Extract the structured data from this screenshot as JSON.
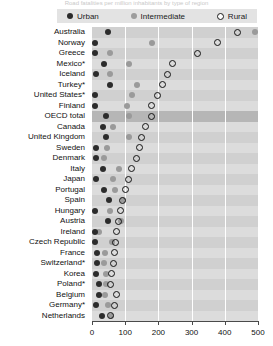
{
  "title": "Road fatalities per million inhabitants by type of region",
  "legend": {
    "position": "top",
    "items": [
      {
        "key": "urban",
        "label": "Urban",
        "marker": "filled-dark-circle",
        "color": "#2c2c2c"
      },
      {
        "key": "intermediate",
        "label": "Intermediate",
        "marker": "filled-gray-circle",
        "color": "#9a9a9a"
      },
      {
        "key": "rural",
        "label": "Rural",
        "marker": "open-circle",
        "color": "#141414"
      }
    ]
  },
  "axis": {
    "x_ticks": [
      "0",
      "100",
      "200",
      "300",
      "400",
      "500"
    ],
    "x_min": 0,
    "x_max": 500
  },
  "chart_data": {
    "type": "scatter",
    "title": "Road fatalities per million inhabitants by type of region",
    "xlabel": "",
    "ylabel": "",
    "xlim": [
      0,
      500
    ],
    "grid": true,
    "legend_position": "top",
    "categories": [
      "Australia",
      "Norway",
      "Greece",
      "Mexico*",
      "Iceland",
      "Turkey*",
      "United States*",
      "Finland",
      "OECD total",
      "Canada",
      "United Kingdom",
      "Sweden",
      "Denmark",
      "Italy",
      "Japan",
      "Portugal",
      "Spain",
      "Hungary",
      "Austria",
      "Ireland",
      "Czech Republic",
      "France",
      "Switzerland*",
      "Korea",
      "Poland*",
      "Belgium",
      "Germany*",
      "Netherlands"
    ],
    "series": [
      {
        "name": "Urban",
        "values": [
          47,
          10,
          10,
          37,
          12,
          53,
          9,
          10,
          41,
          34,
          43,
          12,
          12,
          34,
          12,
          37,
          52,
          10,
          47,
          10,
          10,
          15,
          16,
          13,
          21,
          22,
          11,
          30
        ]
      },
      {
        "name": "Intermediate",
        "values": [
          490,
          180,
          55,
          110,
          55,
          135,
          120,
          105,
          110,
          63,
          112,
          44,
          37,
          80,
          62,
          70,
          92,
          53,
          87,
          22,
          60,
          40,
          35,
          42,
          41,
          38,
          47,
          57
        ]
      },
      {
        "name": "Rural",
        "values": [
          437,
          377,
          318,
          243,
          228,
          213,
          198,
          178,
          180,
          160,
          150,
          142,
          133,
          118,
          110,
          100,
          92,
          86,
          80,
          73,
          70,
          68,
          64,
          60,
          57,
          75,
          68,
          55
        ]
      }
    ],
    "highlighted_row": "OECD total"
  }
}
